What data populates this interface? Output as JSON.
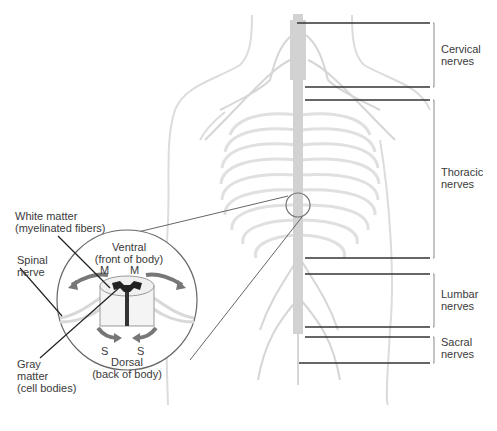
{
  "diagram": {
    "regions": [
      {
        "id": "cervical",
        "line1": "Cervical",
        "line2": "nerves"
      },
      {
        "id": "thoracic",
        "line1": "Thoracic",
        "line2": "nerves"
      },
      {
        "id": "lumbar",
        "line1": "Lumbar",
        "line2": "nerves"
      },
      {
        "id": "sacral",
        "line1": "Sacral",
        "line2": "nerves"
      }
    ],
    "inset": {
      "white_matter": {
        "line1": "White matter",
        "line2": "(myelinated fibers)"
      },
      "spinal_nerve": {
        "line1": "Spinal",
        "line2": "nerve"
      },
      "gray_matter": {
        "line1": "Gray",
        "line2": "matter",
        "line3": "(cell bodies)"
      },
      "ventral": {
        "line1": "Ventral",
        "line2": "(front of body)"
      },
      "dorsal": {
        "line1": "Dorsal",
        "line2": "(back of body)"
      },
      "motor_mark": "M",
      "sensory_mark": "S"
    },
    "colors": {
      "body_outline": "#d9d9d9",
      "nerves": "#cfcfcf",
      "leader_lines": "#333333",
      "gray_matter": "#222222",
      "arrows": "#777777"
    }
  }
}
